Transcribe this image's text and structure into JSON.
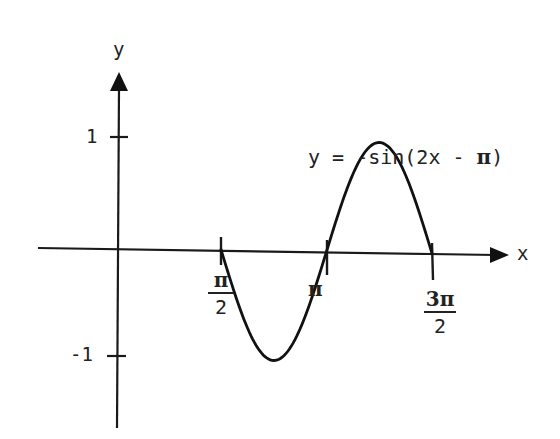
{
  "chart_data": {
    "type": "line",
    "title": "",
    "equation": "y = -sin(2x - π)",
    "equation_parts": {
      "prefix": "y = -sin(2x - ",
      "pi": "π",
      "suffix": ")"
    },
    "xlabel": "x",
    "ylabel": "y",
    "x_ticks": [
      {
        "value": 1.5708,
        "label_num": "π",
        "label_den": "2"
      },
      {
        "value": 3.1416,
        "label": "π"
      },
      {
        "value": 4.7124,
        "label_num": "3π",
        "label_den": "2"
      }
    ],
    "y_ticks": [
      {
        "value": 1,
        "label": "1"
      },
      {
        "value": -1,
        "label": "-1"
      }
    ],
    "xlim": [
      0,
      5.2
    ],
    "ylim": [
      -1.4,
      1.6
    ],
    "series": [
      {
        "name": "y = -sin(2x - π)",
        "x": [
          1.5708,
          1.9635,
          2.3562,
          2.7489,
          3.1416,
          3.5343,
          3.927,
          4.3197,
          4.7124
        ],
        "values": [
          0,
          0.707,
          1,
          0.707,
          0,
          -0.707,
          -1,
          -0.707,
          0
        ]
      }
    ],
    "grid": false,
    "legend": "none"
  },
  "labels": {
    "y_axis": "y",
    "x_axis": "x",
    "tick_y_pos": "1",
    "tick_y_neg": "-1",
    "pi_half_num": "π",
    "pi_half_den": "2",
    "pi": "π",
    "three_pi_half_num": "3π",
    "three_pi_half_den": "2"
  },
  "colors": {
    "ink": "#1a1a1a",
    "background": "#ffffff"
  }
}
